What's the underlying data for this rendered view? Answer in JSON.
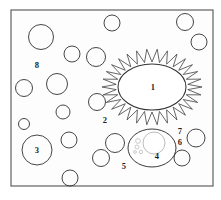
{
  "figure": {
    "background_color": "#ffffff",
    "frame": {
      "x": 11,
      "y": 10,
      "width": 202,
      "height": 176,
      "stroke_color": "#4a4a4a",
      "fill_color": "#fdfdfd"
    },
    "stroke_color": "#3c3c3c",
    "label_color": "#1d1d1d"
  },
  "labels": [
    {
      "id": "label-1",
      "text": "1",
      "x": 153,
      "y": 87
    },
    {
      "id": "label-2",
      "text": "2",
      "x": 105,
      "y": 120
    },
    {
      "id": "label-3",
      "text": "3",
      "x": 37,
      "y": 150
    },
    {
      "id": "label-4",
      "text": "4",
      "x": 157,
      "y": 156
    },
    {
      "id": "label-5",
      "text": "5",
      "x": 124,
      "y": 166
    },
    {
      "id": "label-6",
      "text": "6",
      "x": 180,
      "y": 142
    },
    {
      "id": "label-7",
      "text": "7",
      "x": 180,
      "y": 131
    },
    {
      "id": "label-8",
      "text": "8",
      "x": 37,
      "y": 65
    }
  ],
  "structures": {
    "nucleus": {
      "name": "central-nucleus",
      "cx": 152,
      "cy": 87,
      "rx": 34,
      "ry": 23,
      "label": "1"
    },
    "corona": {
      "name": "spiked-corona",
      "cx": 152,
      "cy": 87,
      "inner_rx": 36,
      "inner_ry": 25,
      "outer_rx": 50,
      "outer_ry": 38,
      "spike_count": 30
    },
    "organelle": {
      "name": "lower-organelle",
      "cx": 152,
      "cy": 148,
      "rx": 24,
      "ry": 19,
      "label": "4",
      "inner_circle": {
        "cx": 154,
        "cy": 143,
        "r": 11
      },
      "granules": [
        {
          "cx": 138,
          "cy": 141,
          "r": 2.4
        },
        {
          "cx": 137,
          "cy": 147,
          "r": 2.0
        },
        {
          "cx": 141,
          "cy": 152,
          "r": 1.7
        },
        {
          "cx": 135,
          "cy": 152,
          "r": 1.4
        }
      ]
    }
  },
  "vesicles": [
    {
      "cx": 41,
      "cy": 37,
      "r": 12.5
    },
    {
      "cx": 72,
      "cy": 54,
      "r": 8.0
    },
    {
      "cx": 96,
      "cy": 57,
      "r": 9.5
    },
    {
      "cx": 112,
      "cy": 23,
      "r": 8.0
    },
    {
      "cx": 185,
      "cy": 22,
      "r": 8.5
    },
    {
      "cx": 199,
      "cy": 42,
      "r": 8.0
    },
    {
      "cx": 24,
      "cy": 88,
      "r": 8.5
    },
    {
      "cx": 57,
      "cy": 84,
      "r": 10.5
    },
    {
      "cx": 97,
      "cy": 102,
      "r": 8.5
    },
    {
      "cx": 63,
      "cy": 112,
      "r": 7.0
    },
    {
      "cx": 24,
      "cy": 124,
      "r": 5.5
    },
    {
      "cx": 69,
      "cy": 140,
      "r": 8.0
    },
    {
      "cx": 37,
      "cy": 150,
      "r": 15.0
    },
    {
      "cx": 115,
      "cy": 143,
      "r": 9.5
    },
    {
      "cx": 101,
      "cy": 158,
      "r": 8.5
    },
    {
      "cx": 70,
      "cy": 178,
      "r": 8.0
    },
    {
      "cx": 196,
      "cy": 138,
      "r": 9.0
    },
    {
      "cx": 182,
      "cy": 158,
      "r": 8.0
    }
  ]
}
